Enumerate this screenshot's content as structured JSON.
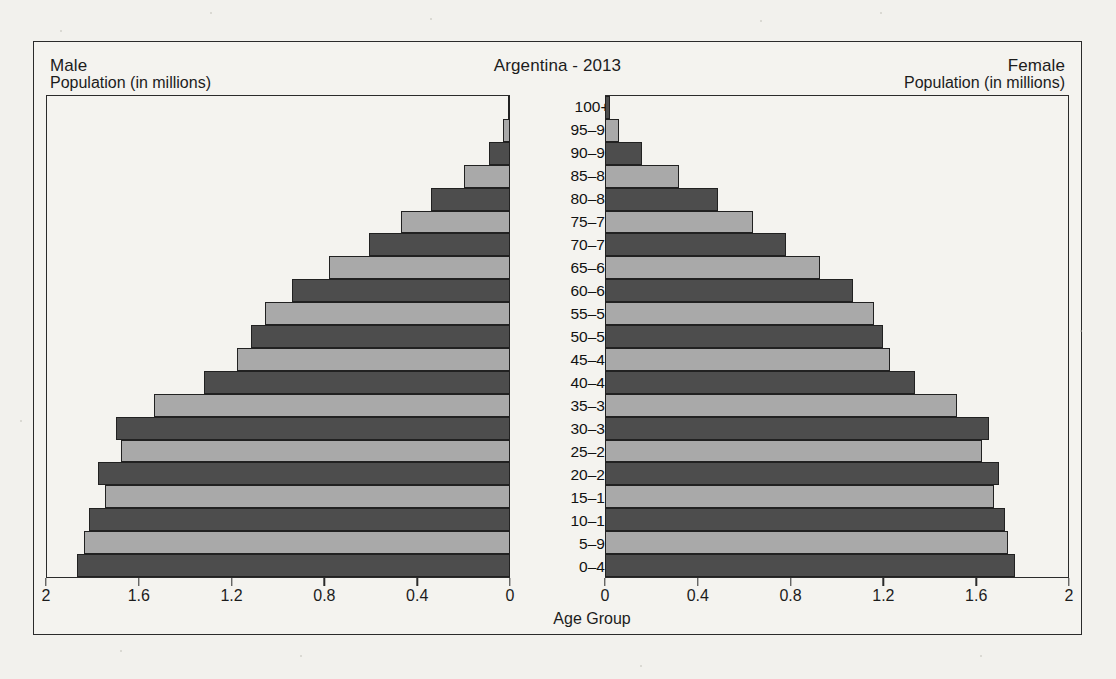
{
  "header": {
    "male_label": "Male",
    "title": "Argentina - 2013",
    "female_label": "Female"
  },
  "axis": {
    "male_title": "Population (in millions)",
    "female_title": "Population (in millions)",
    "center_title": "Age Group",
    "male_ticks": [
      "2",
      "1.6",
      "1.2",
      "0.8",
      "0.4",
      "0"
    ],
    "female_ticks": [
      "0",
      "0.4",
      "0.8",
      "1.2",
      "1.6",
      "2"
    ]
  },
  "colors": {
    "bar_dark": "#4d4d4d",
    "bar_light": "#a9a9a9",
    "outline": "#212121",
    "paper": "#f4f3ef",
    "text": "#1c1c1c"
  },
  "chart_data": {
    "type": "bar",
    "title": "Argentina - 2013",
    "subtype": "population-pyramid",
    "xlabel": "Population (in millions)",
    "ylabel": "Age Group",
    "xlim": [
      0,
      2
    ],
    "xticks": [
      0,
      0.4,
      0.8,
      1.2,
      1.6,
      2
    ],
    "grid": false,
    "legend": [
      "Male",
      "Female"
    ],
    "legend_position": "top-left and top-right",
    "categories": [
      "0–4",
      "5–9",
      "10–14",
      "15–19",
      "20–24",
      "25–29",
      "30–34",
      "35–39",
      "40–44",
      "45–49",
      "50–54",
      "55–59",
      "60–64",
      "65–69",
      "70–74",
      "75–79",
      "80–84",
      "85–89",
      "90–94",
      "95–99",
      "100+"
    ],
    "series": [
      {
        "name": "Male",
        "side": "left",
        "values": [
          1.87,
          1.84,
          1.82,
          1.75,
          1.78,
          1.68,
          1.7,
          1.54,
          1.32,
          1.18,
          1.12,
          1.06,
          0.94,
          0.78,
          0.61,
          0.47,
          0.34,
          0.2,
          0.09,
          0.03,
          0.01
        ]
      },
      {
        "name": "Female",
        "side": "right",
        "values": [
          1.77,
          1.74,
          1.73,
          1.68,
          1.7,
          1.63,
          1.66,
          1.52,
          1.34,
          1.23,
          1.2,
          1.16,
          1.07,
          0.93,
          0.78,
          0.64,
          0.49,
          0.32,
          0.16,
          0.06,
          0.02
        ]
      }
    ]
  }
}
